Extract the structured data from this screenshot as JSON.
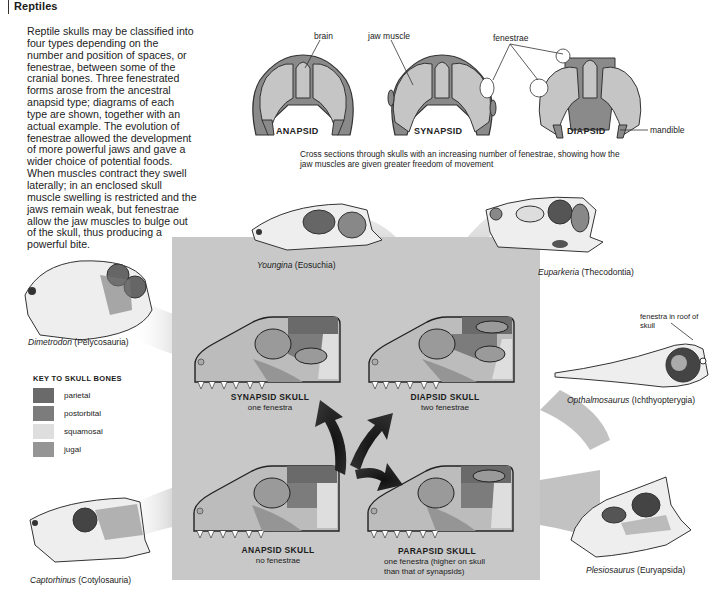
{
  "header": {
    "title": "Reptiles"
  },
  "intro_text": "Reptile skulls may be classified into four types depending on the number and position of spaces, or fenestrae, between some of the cranial bones. Three fenestrated forms arose from the ancestral anapsid type; diagrams of each type are shown, together with an actual example. The evolution of fenestrae allowed the development of more powerful jaws and gave a wider choice of potential foods. When muscles contract they swell laterally; in an enclosed skull muscle swelling is restricted and the jaws remain weak, but fenestrae allow the jaw muscles to bulge out of the skull, thus producing a powerful bite.",
  "cross_sections": {
    "labels": {
      "brain": "brain",
      "jaw_muscle": "jaw muscle",
      "fenestrae": "fenestrae",
      "mandible": "mandible"
    },
    "items": [
      {
        "name": "ANAPSID"
      },
      {
        "name": "SYNAPSID"
      },
      {
        "name": "DIAPSID"
      }
    ],
    "caption": "Cross sections through skulls with an increasing number of fenestrae, showing how the jaw muscles are given greater freedom of movement"
  },
  "species": [
    {
      "genus": "Youngina",
      "group": "(Eosuchia)"
    },
    {
      "genus": "Euparkeria",
      "group": "(Thecodontia)"
    },
    {
      "genus": "Dimetrodon",
      "group": "(Pelycosauria)"
    },
    {
      "genus": "Opthalmosaurus",
      "group": "(Ichthyopterygia)"
    },
    {
      "genus": "Captorhinus",
      "group": "(Cotylosauria)"
    },
    {
      "genus": "Plesiosaurus",
      "group": "(Euryapsida)"
    }
  ],
  "annotations": {
    "fenestra_roof": "fenestra in roof of skull"
  },
  "key": {
    "title": "KEY TO SKULL BONES",
    "items": [
      {
        "label": "parietal",
        "color": "#6a6a6a"
      },
      {
        "label": "postorbital",
        "color": "#7c7c7c"
      },
      {
        "label": "squamosal",
        "color": "#dedede"
      },
      {
        "label": "jugal",
        "color": "#959595"
      }
    ]
  },
  "skull_diagrams": [
    {
      "title": "SYNAPSID SKULL",
      "sub": "one fenestra"
    },
    {
      "title": "DIAPSID SKULL",
      "sub": "two fenestrae"
    },
    {
      "title": "ANAPSID SKULL",
      "sub": "no fenestrae"
    },
    {
      "title": "PARAPSID SKULL",
      "sub": "one fenestra (higher on skull",
      "sub2": "than that of synapsids)"
    }
  ],
  "colors": {
    "panel": "#c8c8c8",
    "band": "#b4b4b4",
    "skull_base": "#b9b9b9",
    "skull_outline": "#2a2a2a",
    "arrow": "#1a1a1a"
  }
}
